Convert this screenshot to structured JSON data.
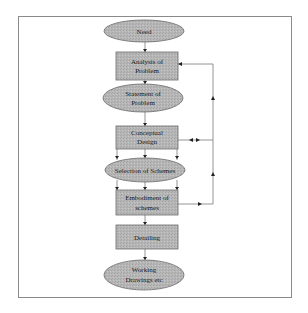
{
  "diagram": {
    "type": "flowchart",
    "colors": {
      "frame": "#8a8a8a",
      "node_fill": "#b4b4b4",
      "node_stroke": "#6a6a6a",
      "edge": "#7a7a7a",
      "arrow": "#222222",
      "text": "#1a1a1a"
    },
    "nodes": [
      {
        "id": "need",
        "shape": "ellipse",
        "lines": [
          "Need"
        ]
      },
      {
        "id": "analysis",
        "shape": "rect",
        "lines": [
          "Analysis of",
          "Problem"
        ]
      },
      {
        "id": "statement",
        "shape": "ellipse",
        "lines": [
          "Statement of",
          "Problem"
        ]
      },
      {
        "id": "conceptual",
        "shape": "rect",
        "lines": [
          "Conceptual",
          "Design"
        ]
      },
      {
        "id": "selection",
        "shape": "ellipse",
        "lines": [
          "Selection of Schemes"
        ]
      },
      {
        "id": "embodiment",
        "shape": "rect",
        "lines": [
          "Embodiment of",
          "schemes"
        ]
      },
      {
        "id": "detailing",
        "shape": "rect",
        "lines": [
          "Detailing"
        ]
      },
      {
        "id": "working",
        "shape": "ellipse",
        "lines": [
          "Working",
          "Drawings etc"
        ]
      }
    ],
    "edges": [
      {
        "from": "need",
        "to": "analysis"
      },
      {
        "from": "analysis",
        "to": "statement"
      },
      {
        "from": "statement",
        "to": "conceptual"
      },
      {
        "from": "conceptual",
        "to": "selection",
        "count": 3
      },
      {
        "from": "selection",
        "to": "embodiment",
        "count": 3
      },
      {
        "from": "embodiment",
        "to": "detailing"
      },
      {
        "from": "detailing",
        "to": "working"
      },
      {
        "from": "embodiment",
        "to": "analysis",
        "type": "feedback"
      },
      {
        "from": "conceptual",
        "to": "feedback-line",
        "type": "bidirectional"
      }
    ]
  }
}
